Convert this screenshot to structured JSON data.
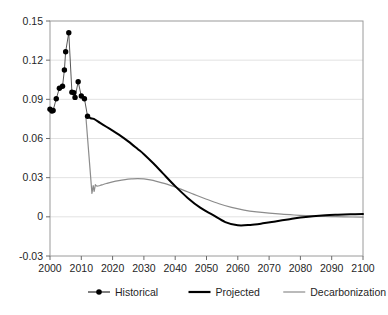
{
  "chart_data": {
    "type": "line",
    "title": "",
    "subtitle": "",
    "xlabel": "",
    "ylabel": "",
    "xlim": [
      2000,
      2100
    ],
    "ylim": [
      -0.03,
      0.15
    ],
    "grid": true,
    "grid_axis": "y",
    "legend_position": "bottom",
    "y_ticks": [
      "0.15",
      "0.12",
      "0.09",
      "0.06",
      "0.03",
      "0",
      "-0.03"
    ],
    "y_tick_values": [
      0.15,
      0.12,
      0.09,
      0.06,
      0.03,
      0,
      -0.03
    ],
    "x_ticks": [
      "2000",
      "2010",
      "2020",
      "2030",
      "2040",
      "2050",
      "2060",
      "2070",
      "2080",
      "2090",
      "2100"
    ],
    "x_tick_values": [
      2000,
      2010,
      2020,
      2030,
      2040,
      2050,
      2060,
      2070,
      2080,
      2090,
      2100
    ],
    "series": [
      {
        "name": "Historical",
        "color": "#000000",
        "style": "line-with-markers",
        "marker": "circle",
        "x": [
          2000,
          2000.6,
          2001,
          2002,
          2003,
          2004,
          2004.6,
          2005,
          2006,
          2007,
          2007.6,
          2008,
          2009,
          2010,
          2011,
          2012
        ],
        "values": [
          0.0825,
          0.081,
          0.0815,
          0.0905,
          0.0985,
          0.1,
          0.1125,
          0.1265,
          0.141,
          0.0955,
          0.095,
          0.0915,
          0.1035,
          0.0925,
          0.0905,
          0.077
        ]
      },
      {
        "name": "Projected",
        "color": "#000000",
        "style": "thick-line",
        "x": [
          2012,
          2013,
          2014,
          2016,
          2018,
          2020,
          2022,
          2025,
          2028,
          2030,
          2033,
          2036,
          2040,
          2044,
          2048,
          2052,
          2056,
          2060,
          2064,
          2068,
          2072,
          2076,
          2080,
          2084,
          2088,
          2092,
          2096,
          2100
        ],
        "values": [
          0.077,
          0.0755,
          0.075,
          0.072,
          0.069,
          0.066,
          0.063,
          0.0578,
          0.052,
          0.048,
          0.041,
          0.0335,
          0.0235,
          0.0145,
          0.007,
          0.0015,
          -0.004,
          -0.0065,
          -0.0062,
          -0.005,
          -0.0035,
          -0.002,
          -0.0005,
          0.0005,
          0.0012,
          0.0016,
          0.0019,
          0.0022
        ]
      },
      {
        "name": "Decarbonization",
        "color": "#8c8c8c",
        "style": "thin-line",
        "x": [
          2011.5,
          2013.4,
          2013.8,
          2014.1,
          2014.5,
          2015,
          2016,
          2017,
          2018,
          2020,
          2022,
          2024,
          2026,
          2028,
          2030,
          2032,
          2034,
          2038,
          2042,
          2046,
          2050,
          2054,
          2058,
          2062,
          2066,
          2070,
          2074,
          2078,
          2082,
          2086,
          2090,
          2094,
          2100
        ],
        "values": [
          0.0755,
          0.018,
          0.024,
          0.0195,
          0.0245,
          0.0235,
          0.024,
          0.0248,
          0.0255,
          0.0268,
          0.0278,
          0.0285,
          0.029,
          0.0293,
          0.029,
          0.0283,
          0.0272,
          0.0245,
          0.021,
          0.0172,
          0.0135,
          0.01,
          0.0072,
          0.0052,
          0.0038,
          0.0028,
          0.002,
          0.0014,
          0.0009,
          0.0005,
          0.0002,
          0.0,
          -0.0003
        ]
      }
    ],
    "legend": [
      {
        "label": "Historical",
        "marker": "circle-on-line",
        "color": "#000000"
      },
      {
        "label": "Projected",
        "marker": "thick-line",
        "color": "#000000"
      },
      {
        "label": "Decarbonization",
        "marker": "thin-line",
        "color": "#8c8c8c"
      }
    ]
  }
}
